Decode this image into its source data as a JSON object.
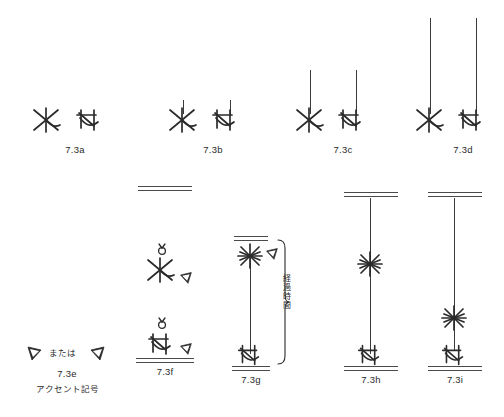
{
  "figure": {
    "title_visible": false,
    "background_color": "#ffffff",
    "ink_color": "#2b2b2b",
    "stem_color": "#3a3a3a",
    "rule_color": "#4a4a4a"
  },
  "panels": [
    {
      "id": "7.3a",
      "label": "7.3a",
      "caption": "",
      "row": "top",
      "stem": "none",
      "glyphs": [
        "x-cross-note",
        "crossed-hook-note"
      ]
    },
    {
      "id": "7.3b",
      "label": "7.3b",
      "caption": "",
      "row": "top",
      "stem": "short",
      "glyphs": [
        "x-cross-note",
        "crossed-hook-note"
      ]
    },
    {
      "id": "7.3c",
      "label": "7.3c",
      "caption": "",
      "row": "top",
      "stem": "medium",
      "glyphs": [
        "x-cross-note",
        "crossed-hook-note"
      ]
    },
    {
      "id": "7.3d",
      "label": "7.3d",
      "caption": "",
      "row": "top",
      "stem": "long",
      "glyphs": [
        "x-cross-note",
        "crossed-hook-note"
      ]
    },
    {
      "id": "7.3e",
      "label": "7.3e",
      "caption": "アクセント記号",
      "row": "bottom",
      "or_text": "または",
      "glyphs": [
        "accent-wedge-left",
        "accent-wedge-right"
      ]
    },
    {
      "id": "7.3f",
      "label": "7.3f",
      "caption": "",
      "row": "bottom",
      "glyphs": [
        "ring-mark",
        "x-cross-note",
        "accent-wedge-right",
        "ring-mark",
        "crossed-hook-note",
        "accent-wedge-right"
      ],
      "rules": [
        "top-double",
        "bottom-double"
      ]
    },
    {
      "id": "7.3g",
      "label": "7.3g",
      "caption": "",
      "row": "bottom",
      "annotation": "経過時間",
      "brace": "right-curly",
      "glyphs": [
        "star-burst",
        "accent-wedge-right",
        "crossed-hook-note"
      ],
      "rules": [
        "top-double",
        "bottom-double"
      ]
    },
    {
      "id": "7.3h",
      "label": "7.3h",
      "caption": "",
      "row": "bottom",
      "star_position": "upper-middle",
      "glyphs": [
        "star-burst",
        "crossed-hook-note"
      ],
      "rules": [
        "top-double",
        "bottom-double"
      ]
    },
    {
      "id": "7.3i",
      "label": "7.3i",
      "caption": "",
      "row": "bottom",
      "star_position": "lower",
      "glyphs": [
        "star-burst",
        "crossed-hook-note"
      ],
      "rules": [
        "top-double",
        "bottom-double"
      ]
    }
  ]
}
